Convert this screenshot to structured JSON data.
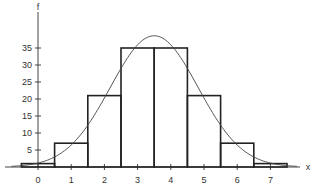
{
  "chart_data": {
    "type": "bar",
    "title": "",
    "xlabel": "x",
    "ylabel": "f",
    "categories": [
      "0",
      "1",
      "2",
      "3",
      "4",
      "5",
      "6",
      "7"
    ],
    "values": [
      1,
      7,
      21,
      35,
      35,
      21,
      7,
      1
    ],
    "x_ticks": [
      0,
      1,
      2,
      3,
      4,
      5,
      6,
      7
    ],
    "y_ticks": [
      5,
      10,
      15,
      20,
      25,
      30,
      35
    ],
    "ylim": [
      0,
      40
    ],
    "xlim": [
      -0.9,
      7.9
    ],
    "grid": false,
    "legend": null,
    "overlay_curve": {
      "type": "normal",
      "mean": 3.5,
      "sd": 1.3229,
      "scale": 128,
      "peak": 38.6
    },
    "bar_width": 1,
    "colors": {
      "bars": "#222222",
      "curve": "#444444",
      "axes": "#444444"
    }
  }
}
